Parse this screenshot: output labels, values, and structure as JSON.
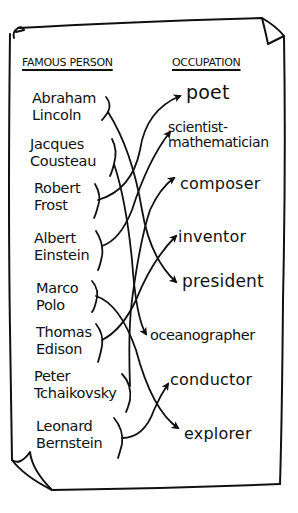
{
  "headers": {
    "left": "FAMOUS PERSON",
    "right": "OCCUPATION"
  },
  "people": [
    {
      "name": "Abraham\nLincoln",
      "matches": "president"
    },
    {
      "name": "Jacques\nCousteau",
      "matches": "oceanographer"
    },
    {
      "name": "Robert\nFrost",
      "matches": "poet"
    },
    {
      "name": "Albert\nEinstein",
      "matches": "scientist-mathematician"
    },
    {
      "name": "Marco\nPolo",
      "matches": "explorer"
    },
    {
      "name": "Thomas\nEdison",
      "matches": "inventor"
    },
    {
      "name": "Peter\nTchaikovsky",
      "matches": "composer"
    },
    {
      "name": "Leonard\nBernstein",
      "matches": "conductor"
    }
  ],
  "occupations": [
    {
      "label": "poet"
    },
    {
      "label": "scientist-\nmathematician"
    },
    {
      "label": "composer"
    },
    {
      "label": "inventor"
    },
    {
      "label": "president"
    },
    {
      "label": "oceanographer"
    },
    {
      "label": "conductor"
    },
    {
      "label": "explorer"
    }
  ],
  "connections": [
    {
      "from": "Abraham Lincoln",
      "to": "president"
    },
    {
      "from": "Jacques Cousteau",
      "to": "oceanographer"
    },
    {
      "from": "Robert Frost",
      "to": "poet"
    },
    {
      "from": "Albert Einstein",
      "to": "scientist-mathematician"
    },
    {
      "from": "Marco Polo",
      "to": "explorer"
    },
    {
      "from": "Thomas Edison",
      "to": "inventor"
    },
    {
      "from": "Peter Tchaikovsky",
      "to": "composer"
    },
    {
      "from": "Leonard Bernstein",
      "to": "conductor"
    }
  ],
  "colors": {
    "ink": "#111111",
    "paper": "#ffffff"
  }
}
